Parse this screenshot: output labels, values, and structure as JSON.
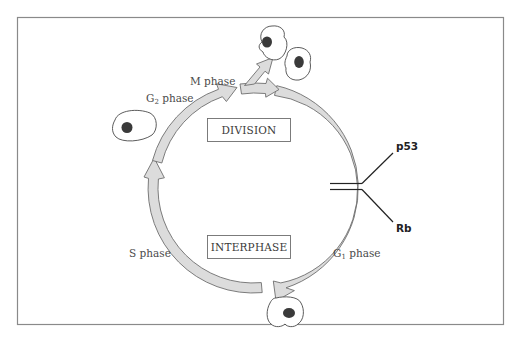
{
  "diagram": {
    "boxes": {
      "division": "DIVISION",
      "interphase": "INTERPHASE"
    },
    "phases": {
      "m": "M phase",
      "g2_prefix": "G",
      "g2_sub": "2",
      "g2_suffix": " phase",
      "s": "S phase",
      "g1_prefix": "G",
      "g1_sub": "1",
      "g1_suffix": " phase"
    },
    "regulators": {
      "top": "p53",
      "bottom": "Rb"
    },
    "colors": {
      "arrow_fill": "#dcdcdc",
      "arrow_stroke": "#6e6e6e",
      "frame": "#8a8a8a",
      "nucleus": "#3a3a3a",
      "inhibitor_line": "#222222"
    }
  }
}
